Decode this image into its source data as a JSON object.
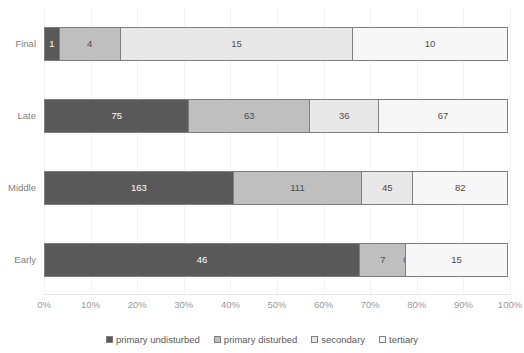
{
  "chart_data": {
    "type": "bar",
    "subtype": "stacked-bar-horizontal-100pct",
    "title": "",
    "xlabel": "",
    "ylabel": "",
    "orientation": "horizontal",
    "stacked": true,
    "normalized": true,
    "grid": true,
    "legend_position": "bottom",
    "xlim": [
      0,
      100
    ],
    "xtick_labels": [
      "0%",
      "10%",
      "20%",
      "30%",
      "40%",
      "50%",
      "60%",
      "70%",
      "80%",
      "90%",
      "100%"
    ],
    "xtick_values": [
      0,
      10,
      20,
      30,
      40,
      50,
      60,
      70,
      80,
      90,
      100
    ],
    "categories": [
      "Final",
      "Late",
      "Middle",
      "Early"
    ],
    "series": [
      {
        "name": "primary undisturbed",
        "color": "#595959",
        "values": [
          1,
          75,
          163,
          46
        ]
      },
      {
        "name": "primary disturbed",
        "color": "#bfbfbf",
        "values": [
          4,
          63,
          111,
          7
        ]
      },
      {
        "name": "secondary",
        "color": "#e8e8e8",
        "values": [
          15,
          36,
          45,
          0
        ]
      },
      {
        "name": "tertiary",
        "color": "#f7f7f7",
        "values": [
          10,
          67,
          82,
          15
        ]
      }
    ],
    "rows": [
      {
        "category": "Final",
        "total": 30,
        "segments": [
          {
            "series": "primary undisturbed",
            "value": 1,
            "label": "1",
            "percent": 3.33,
            "color": "#595959"
          },
          {
            "series": "primary disturbed",
            "value": 4,
            "label": "4",
            "percent": 13.33,
            "color": "#bfbfbf"
          },
          {
            "series": "secondary",
            "value": 15,
            "label": "15",
            "percent": 50.0,
            "color": "#e8e8e8"
          },
          {
            "series": "tertiary",
            "value": 10,
            "label": "10",
            "percent": 33.33,
            "color": "#f7f7f7"
          }
        ]
      },
      {
        "category": "Late",
        "total": 241,
        "segments": [
          {
            "series": "primary undisturbed",
            "value": 75,
            "label": "75",
            "percent": 31.12,
            "color": "#595959"
          },
          {
            "series": "primary disturbed",
            "value": 63,
            "label": "63",
            "percent": 26.14,
            "color": "#bfbfbf"
          },
          {
            "series": "secondary",
            "value": 36,
            "label": "36",
            "percent": 14.94,
            "color": "#e8e8e8"
          },
          {
            "series": "tertiary",
            "value": 67,
            "label": "67",
            "percent": 27.8,
            "color": "#f7f7f7"
          }
        ]
      },
      {
        "category": "Middle",
        "total": 401,
        "segments": [
          {
            "series": "primary undisturbed",
            "value": 163,
            "label": "163",
            "percent": 40.65,
            "color": "#595959"
          },
          {
            "series": "primary disturbed",
            "value": 111,
            "label": "111",
            "percent": 27.68,
            "color": "#bfbfbf"
          },
          {
            "series": "secondary",
            "value": 45,
            "label": "45",
            "percent": 11.22,
            "color": "#e8e8e8"
          },
          {
            "series": "tertiary",
            "value": 82,
            "label": "82",
            "percent": 20.45,
            "color": "#f7f7f7"
          }
        ]
      },
      {
        "category": "Early",
        "total": 68,
        "segments": [
          {
            "series": "primary undisturbed",
            "value": 46,
            "label": "46",
            "percent": 67.65,
            "color": "#595959"
          },
          {
            "series": "primary disturbed",
            "value": 7,
            "label": "7",
            "percent": 10.29,
            "color": "#bfbfbf"
          },
          {
            "series": "secondary",
            "value": 0,
            "label": "0",
            "percent": 0.0,
            "color": "#e8e8e8"
          },
          {
            "series": "tertiary",
            "value": 15,
            "label": "15",
            "percent": 22.06,
            "color": "#f7f7f7"
          }
        ]
      }
    ],
    "legend": [
      {
        "label": "primary undisturbed",
        "color": "#595959"
      },
      {
        "label": "primary disturbed",
        "color": "#bfbfbf"
      },
      {
        "label": "secondary",
        "color": "#e8e8e8"
      },
      {
        "label": "tertiary",
        "color": "#f7f7f7"
      }
    ]
  },
  "style": {
    "segment_border": "#7f7f7f",
    "gridline": "#f2f2f2",
    "axis_text": "#999999",
    "category_text": "#808080",
    "legend_text": "#595959",
    "background": "#ffffff"
  }
}
